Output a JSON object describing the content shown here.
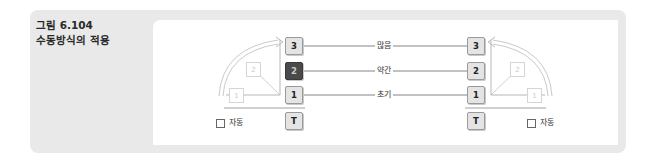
{
  "caption": {
    "figure_number": "그림 6.104",
    "title": "수동방식의 적용"
  },
  "levels": [
    {
      "id": "3",
      "label": "많음"
    },
    {
      "id": "2",
      "label": "약간"
    },
    {
      "id": "1",
      "label": "초기"
    }
  ],
  "left_column": {
    "boxes": [
      "3",
      "2",
      "1",
      "T"
    ],
    "selected": "2",
    "ghost_boxes": [
      "2",
      "1"
    ],
    "auto_label": "자동"
  },
  "right_column": {
    "boxes": [
      "3",
      "2",
      "1",
      "T"
    ],
    "ghost_boxes": [
      "2",
      "1"
    ],
    "auto_label": "자동"
  },
  "colors": {
    "panel_bg": "#e9e9e9",
    "box_bg": "#e4e4e4",
    "selected_box_bg": "#4a4a4a"
  }
}
